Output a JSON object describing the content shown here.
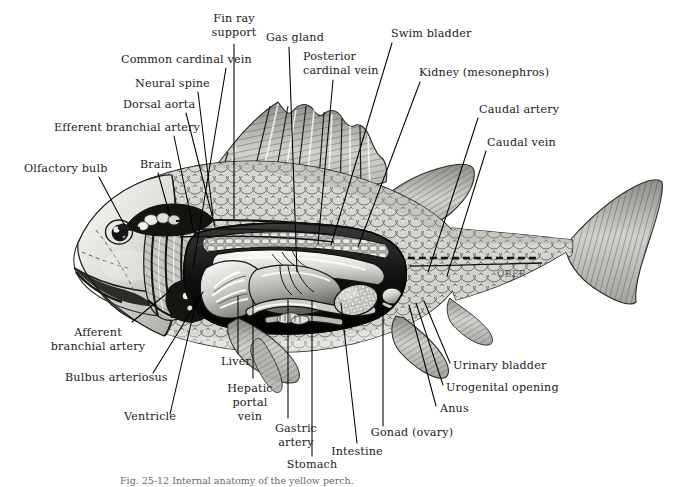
{
  "figure": {
    "background_color": "#ffffff",
    "ink_color": "#000000",
    "label_color": "#1a1a1a",
    "caption": "Fig. 25-12 Internal anatomy of the yellow perch.",
    "signature": "OBER"
  },
  "labels": [
    {
      "id": "fin-ray-support",
      "text_lines": [
        "Fin ray",
        "support"
      ],
      "align": "middle",
      "tx": 234,
      "ty": 22,
      "line_h": 14,
      "leader": [
        [
          234,
          44
        ],
        [
          234,
          218
        ]
      ]
    },
    {
      "id": "gas-gland",
      "text_lines": [
        "Gas gland"
      ],
      "align": "start",
      "tx": 266,
      "ty": 41,
      "line_h": 14,
      "leader": [
        [
          289,
          47
        ],
        [
          297,
          272
        ]
      ]
    },
    {
      "id": "swim-bladder",
      "text_lines": [
        "Swim bladder"
      ],
      "align": "start",
      "tx": 391,
      "ty": 37,
      "line_h": 14,
      "leader": [
        [
          392,
          43
        ],
        [
          331,
          245
        ]
      ]
    },
    {
      "id": "common-cardinal-vein",
      "text_lines": [
        "Common cardinal vein"
      ],
      "align": "start",
      "tx": 121,
      "ty": 63,
      "line_h": 14,
      "leader": [
        [
          226,
          68
        ],
        [
          193,
          268
        ]
      ]
    },
    {
      "id": "posterior-cardinal-vein",
      "text_lines": [
        "Posterior",
        "cardinal vein"
      ],
      "align": "start",
      "tx": 303,
      "ty": 60,
      "line_h": 14,
      "leader": [
        [
          333,
          80
        ],
        [
          318,
          244
        ]
      ]
    },
    {
      "id": "kidney-mesonephros",
      "text_lines": [
        "Kidney (mesonephros)"
      ],
      "align": "start",
      "tx": 419,
      "ty": 76,
      "line_h": 14,
      "leader": [
        [
          420,
          82
        ],
        [
          358,
          247
        ]
      ]
    },
    {
      "id": "neural-spine",
      "text_lines": [
        "Neural  spine"
      ],
      "align": "start",
      "tx": 135,
      "ty": 87,
      "line_h": 14,
      "leader": [
        [
          198,
          92
        ],
        [
          213,
          216
        ]
      ]
    },
    {
      "id": "caudal-artery",
      "text_lines": [
        "Caudal artery"
      ],
      "align": "start",
      "tx": 479,
      "ty": 113,
      "line_h": 14,
      "leader": [
        [
          478,
          118
        ],
        [
          428,
          272
        ]
      ]
    },
    {
      "id": "dorsal-aorta",
      "text_lines": [
        "Dorsal aorta"
      ],
      "align": "start",
      "tx": 123,
      "ty": 108,
      "line_h": 14,
      "leader": [
        [
          186,
          113
        ],
        [
          215,
          227
        ]
      ]
    },
    {
      "id": "caudal-vein",
      "text_lines": [
        "Caudal vein"
      ],
      "align": "start",
      "tx": 487,
      "ty": 146,
      "line_h": 14,
      "leader": [
        [
          486,
          151
        ],
        [
          447,
          276
        ]
      ]
    },
    {
      "id": "efferent-branchial-artery",
      "text_lines": [
        "Efferent branchial artery"
      ],
      "align": "start",
      "tx": 54,
      "ty": 131,
      "line_h": 14,
      "leader": [
        [
          174,
          136
        ],
        [
          195,
          237
        ]
      ]
    },
    {
      "id": "olfactory-bulb",
      "text_lines": [
        "Olfactory bulb"
      ],
      "align": "start",
      "tx": 24,
      "ty": 172,
      "line_h": 14,
      "leader": [
        [
          99,
          177
        ],
        [
          125,
          226
        ]
      ]
    },
    {
      "id": "brain",
      "text_lines": [
        "Brain"
      ],
      "align": "start",
      "tx": 140,
      "ty": 168,
      "line_h": 14,
      "leader": [
        [
          158,
          173
        ],
        [
          170,
          216
        ]
      ]
    },
    {
      "id": "afferent-branchial-artery",
      "text_lines": [
        "Afferent",
        "branchial artery"
      ],
      "align": "middle",
      "tx": 98,
      "ty": 336,
      "line_h": 14,
      "leader": [
        [
          132,
          322
        ],
        [
          171,
          290
        ]
      ]
    },
    {
      "id": "bulbus-arteriosus",
      "text_lines": [
        "Bulbus arteriosus"
      ],
      "align": "start",
      "tx": 65,
      "ty": 381,
      "line_h": 14,
      "leader": [
        [
          153,
          373
        ],
        [
          203,
          292
        ]
      ]
    },
    {
      "id": "ventricle",
      "text_lines": [
        "Ventricle"
      ],
      "align": "start",
      "tx": 124,
      "ty": 420,
      "line_h": 14,
      "leader": [
        [
          170,
          414
        ],
        [
          197,
          298
        ]
      ]
    },
    {
      "id": "liver",
      "text_lines": [
        "Liver"
      ],
      "align": "start",
      "tx": 221,
      "ty": 365,
      "line_h": 14,
      "leader": [
        [
          238,
          353
        ],
        [
          238,
          296
        ]
      ]
    },
    {
      "id": "hepatic-portal-vein",
      "text_lines": [
        "Hepatic",
        "portal",
        "vein"
      ],
      "align": "middle",
      "tx": 250,
      "ty": 392,
      "line_h": 14,
      "leader": [
        [
          253,
          378
        ],
        [
          253,
          300
        ]
      ]
    },
    {
      "id": "gastric-artery",
      "text_lines": [
        "Gastric",
        "artery"
      ],
      "align": "middle",
      "tx": 296,
      "ty": 432,
      "line_h": 14,
      "leader": [
        [
          288,
          418
        ],
        [
          288,
          300
        ]
      ]
    },
    {
      "id": "stomach",
      "text_lines": [
        "Stomach"
      ],
      "align": "middle",
      "tx": 312,
      "ty": 468,
      "line_h": 14,
      "leader": [
        [
          312,
          456
        ],
        [
          312,
          300
        ]
      ]
    },
    {
      "id": "intestine",
      "text_lines": [
        "Intestine"
      ],
      "align": "middle",
      "tx": 357,
      "ty": 455,
      "line_h": 14,
      "leader": [
        [
          357,
          443
        ],
        [
          341,
          303
        ]
      ]
    },
    {
      "id": "gonad-ovary",
      "text_lines": [
        "Gonad (ovary)"
      ],
      "align": "middle",
      "tx": 412,
      "ty": 436,
      "line_h": 14,
      "leader": [
        [
          383,
          426
        ],
        [
          383,
          305
        ]
      ]
    },
    {
      "id": "anus",
      "text_lines": [
        "Anus"
      ],
      "align": "start",
      "tx": 440,
      "ty": 412,
      "line_h": 14,
      "leader": [
        [
          436,
          406
        ],
        [
          409,
          305
        ]
      ]
    },
    {
      "id": "urogenital-opening",
      "text_lines": [
        "Urogenital  opening"
      ],
      "align": "start",
      "tx": 446,
      "ty": 391,
      "line_h": 14,
      "leader": [
        [
          443,
          385
        ],
        [
          416,
          303
        ]
      ]
    },
    {
      "id": "urinary-bladder",
      "text_lines": [
        "Urinary  bladder"
      ],
      "align": "start",
      "tx": 453,
      "ty": 369,
      "line_h": 14,
      "leader": [
        [
          450,
          363
        ],
        [
          424,
          301
        ]
      ]
    }
  ],
  "fish": {
    "parts": [
      "body-outline",
      "head",
      "mouth",
      "eye",
      "operculum",
      "gill-arches",
      "brain",
      "olfactory-bulb",
      "dorsal-fin-spinous",
      "dorsal-fin-soft",
      "pectoral-fin",
      "pelvic-fin",
      "anal-fin",
      "caudal-fin",
      "scales",
      "vertebral-column",
      "swim-bladder",
      "kidney",
      "liver",
      "stomach",
      "intestine",
      "gonad",
      "heart",
      "lateral-line"
    ]
  }
}
